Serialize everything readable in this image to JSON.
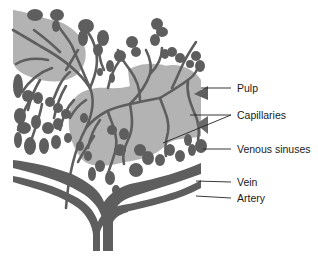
{
  "diagram": {
    "colors": {
      "background": "#ffffff",
      "pulp": "#b3b3b3",
      "vessels": "#5e5e5e",
      "leader_lines": "#222222",
      "text": "#1a1a1a"
    },
    "labels": [
      {
        "id": "pulp",
        "text": "Pulp",
        "x": 237,
        "y": 83,
        "pointer_from": [
          231,
          88
        ],
        "pointer_to": [
          [
            201,
            88
          ]
        ]
      },
      {
        "id": "capillaries",
        "text": "Capillaries",
        "x": 237,
        "y": 110,
        "pointer_from": [
          231,
          115
        ],
        "pointer_to": [
          [
            190,
            115
          ],
          [
            163,
            143
          ]
        ]
      },
      {
        "id": "venous-sinuses",
        "text": "Venous sinuses",
        "x": 237,
        "y": 144,
        "pointer_from": [
          231,
          149
        ],
        "pointer_to": [
          [
            203,
            149
          ]
        ]
      },
      {
        "id": "vein",
        "text": "Vein",
        "x": 237,
        "y": 177,
        "pointer_from": [
          231,
          182
        ],
        "pointer_to": [
          [
            196,
            181
          ]
        ]
      },
      {
        "id": "artery",
        "text": "Artery",
        "x": 237,
        "y": 193,
        "pointer_from": [
          231,
          198
        ],
        "pointer_to": [
          [
            196,
            196
          ]
        ]
      }
    ]
  }
}
